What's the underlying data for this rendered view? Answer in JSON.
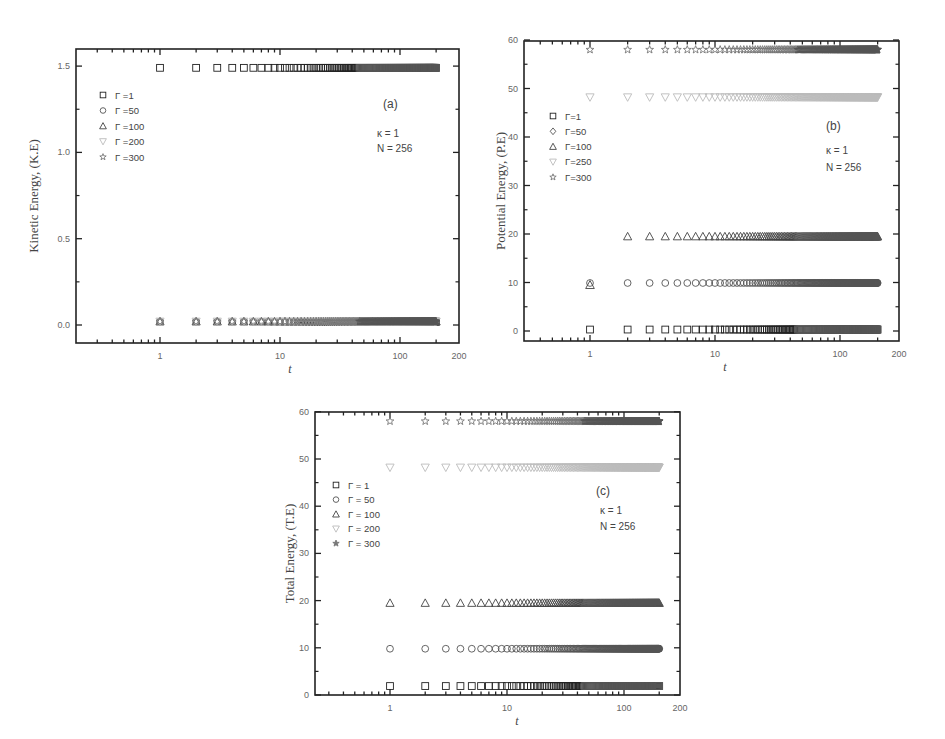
{
  "chart_data": [
    {
      "id": "a",
      "type": "scatter",
      "panel_label": "(a)",
      "title": "",
      "xlabel": "t",
      "ylabel": "Kinetic Energy, (K.E)",
      "xscale": "log",
      "x_ticks": [
        "1",
        "10",
        "100",
        "200"
      ],
      "y_ticks": [
        "0.0",
        "0.5",
        "1.0",
        "1.5"
      ],
      "ylim": [
        -0.1,
        1.6
      ],
      "annotations": [
        "κ = 1",
        "N = 256"
      ],
      "legend_position": "upper-left",
      "legend": [
        {
          "marker": "square",
          "label": "Γ =1"
        },
        {
          "marker": "circle",
          "label": "Γ =50"
        },
        {
          "marker": "triangle-up",
          "label": "Γ =100"
        },
        {
          "marker": "triangle-down",
          "label": "Γ =200"
        },
        {
          "marker": "star",
          "label": "Γ =300"
        }
      ],
      "x_range": [
        1,
        200
      ],
      "series": [
        {
          "name": "Γ=1",
          "marker": "square",
          "value": 1.49
        },
        {
          "name": "Γ=50",
          "marker": "circle",
          "value": 0.02
        },
        {
          "name": "Γ=100",
          "marker": "triangle-up",
          "value": 0.02
        },
        {
          "name": "Γ=200",
          "marker": "triangle-down",
          "value": 0.02
        },
        {
          "name": "Γ=300",
          "marker": "star",
          "value": 0.02
        }
      ]
    },
    {
      "id": "b",
      "type": "scatter",
      "panel_label": "(b)",
      "title": "",
      "xlabel": "t",
      "ylabel": "Potential Energy, (P.E)",
      "xscale": "log",
      "x_ticks": [
        "1",
        "10",
        "100",
        "200"
      ],
      "y_ticks": [
        "0",
        "10",
        "20",
        "30",
        "40",
        "50",
        "60"
      ],
      "ylim": [
        -2,
        60
      ],
      "annotations": [
        "κ  = 1",
        "N  = 256"
      ],
      "legend_position": "upper-left",
      "legend": [
        {
          "marker": "square",
          "label": "Γ=1"
        },
        {
          "marker": "diamond",
          "label": "Γ=50"
        },
        {
          "marker": "triangle-up",
          "label": "Γ=100"
        },
        {
          "marker": "triangle-down",
          "label": "Γ=250"
        },
        {
          "marker": "star",
          "label": "Γ=300"
        }
      ],
      "x_range": [
        1,
        200
      ],
      "series": [
        {
          "name": "Γ=1",
          "marker": "square",
          "value": 0.3
        },
        {
          "name": "Γ=50",
          "marker": "circle",
          "value": 9.9,
          "first_point": {
            "t": 1,
            "marker": "triangle-up",
            "value": 9.5
          }
        },
        {
          "name": "Γ=100",
          "marker": "triangle-up",
          "value": 19.5,
          "start_t": 2
        },
        {
          "name": "Γ=250",
          "marker": "triangle-down",
          "value": 48.2
        },
        {
          "name": "Γ=300",
          "marker": "star",
          "value": 58.0
        }
      ]
    },
    {
      "id": "c",
      "type": "scatter",
      "panel_label": "(c)",
      "title": "",
      "xlabel": "t",
      "ylabel": "Total Energy, (T.E)",
      "xscale": "log",
      "x_ticks": [
        "1",
        "10",
        "100",
        "200"
      ],
      "y_ticks": [
        "0",
        "10",
        "20",
        "30",
        "40",
        "50",
        "60"
      ],
      "ylim": [
        0,
        60
      ],
      "annotations": [
        "κ = 1",
        "N = 256"
      ],
      "legend_position": "upper-left",
      "legend": [
        {
          "marker": "square",
          "label": "Γ = 1"
        },
        {
          "marker": "circle",
          "label": "Γ = 50"
        },
        {
          "marker": "triangle-up",
          "label": "Γ = 100"
        },
        {
          "marker": "triangle-down",
          "label": "Γ = 200"
        },
        {
          "marker": "star-filled",
          "label": "Γ = 300"
        }
      ],
      "x_range": [
        1,
        200
      ],
      "series": [
        {
          "name": "Γ=1",
          "marker": "square",
          "value": 1.9
        },
        {
          "name": "Γ=50",
          "marker": "circle",
          "value": 9.8
        },
        {
          "name": "Γ=100",
          "marker": "triangle-up",
          "value": 19.5
        },
        {
          "name": "Γ=200",
          "marker": "triangle-down",
          "value": 48.2
        },
        {
          "name": "Γ=300",
          "marker": "star",
          "value": 58.0
        }
      ]
    }
  ]
}
